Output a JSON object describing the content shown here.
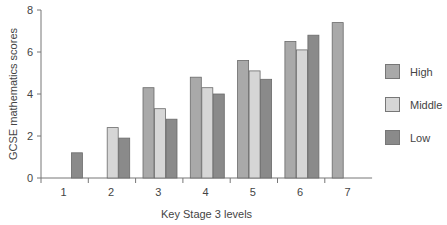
{
  "chart_data": {
    "type": "bar",
    "title": "",
    "xlabel": "Key Stage 3 levels",
    "ylabel": "GCSE mathematics scores",
    "ylim": [
      0,
      8
    ],
    "yticks": [
      0,
      2,
      4,
      6,
      8
    ],
    "categories": [
      "1",
      "2",
      "3",
      "4",
      "5",
      "6",
      "7"
    ],
    "series": [
      {
        "name": "High",
        "color": "#a9a9a9",
        "values": [
          null,
          null,
          4.3,
          4.8,
          5.6,
          6.5,
          7.4
        ]
      },
      {
        "name": "Middle",
        "color": "#d6d6d6",
        "values": [
          null,
          2.4,
          3.3,
          4.3,
          5.1,
          6.1,
          null
        ]
      },
      {
        "name": "Low",
        "color": "#8a8a8a",
        "values": [
          1.2,
          1.9,
          2.8,
          4.0,
          4.7,
          6.8,
          null
        ]
      }
    ],
    "grid": false,
    "legend_position": "right"
  },
  "legend": {
    "items": [
      {
        "label": "High",
        "color": "#a9a9a9"
      },
      {
        "label": "Middle",
        "color": "#d6d6d6"
      },
      {
        "label": "Low",
        "color": "#8a8a8a"
      }
    ]
  }
}
